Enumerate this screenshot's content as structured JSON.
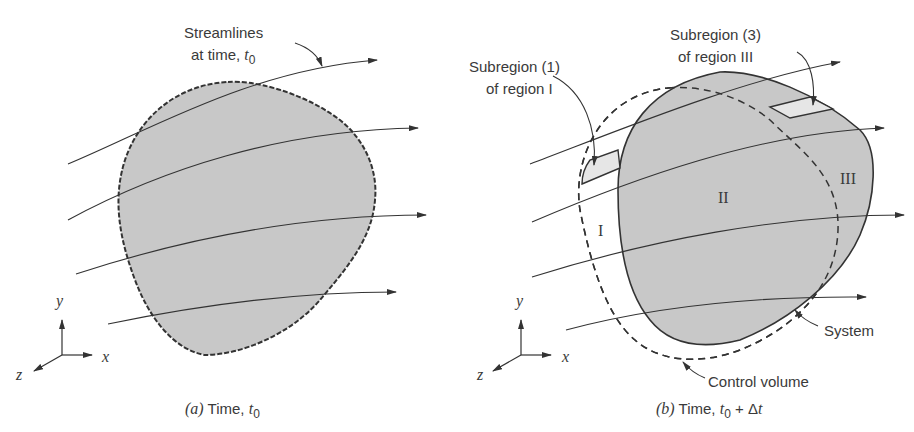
{
  "figure": {
    "panel_a": {
      "caption_prefix": "(a)",
      "caption_text": "Time, t0",
      "caption_label": "Time, ",
      "caption_var": "t",
      "caption_sub": "0",
      "annotation_line1": "Streamlines",
      "annotation_line2": "at time, t0",
      "annotation_line2_text": "at time, ",
      "annotation_var": "t",
      "annotation_sub": "0",
      "axes": {
        "x": "x",
        "y": "y",
        "z": "z"
      }
    },
    "panel_b": {
      "caption_prefix": "(b)",
      "caption_text": "Time, t0 + Δt",
      "caption_label": "Time, ",
      "caption_var": "t",
      "caption_sub": "0",
      "caption_suffix": " + Δ",
      "caption_var2": "t",
      "subregion1_line1": "Subregion (1)",
      "subregion1_line2": "of region I",
      "subregion3_line1": "Subregion (3)",
      "subregion3_line2": "of region III",
      "region_I": "I",
      "region_II": "II",
      "region_III": "III",
      "system_label": "System",
      "control_volume_label": "Control volume",
      "axes": {
        "x": "x",
        "y": "y",
        "z": "z"
      }
    },
    "colors": {
      "fill": "#c8c8c8",
      "light_fill": "#e6e6e6",
      "stroke": "#333333",
      "text": "#3a3a3a"
    }
  }
}
